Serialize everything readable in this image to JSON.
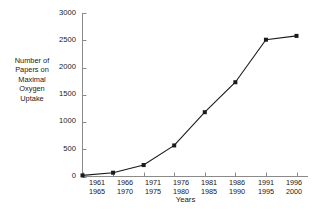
{
  "chart_data": {
    "type": "line",
    "title": "",
    "xlabel": "Years",
    "ylabel": "Number of Papers on Maximal Oxygen Uptake",
    "ylabel_lines": [
      "Number of",
      "Papers on",
      "Maximal",
      "Oxygen",
      "Uptake"
    ],
    "categories": [
      "1961\n1965",
      "1966\n1970",
      "1971\n1975",
      "1976\n1980",
      "1981\n1985",
      "1986\n1990",
      "1991\n1995",
      "1996\n2000"
    ],
    "category_lines": [
      {
        "top": "1961",
        "bottom": "1965"
      },
      {
        "top": "1966",
        "bottom": "1970"
      },
      {
        "top": "1971",
        "bottom": "1975"
      },
      {
        "top": "1976",
        "bottom": "1980"
      },
      {
        "top": "1981",
        "bottom": "1985"
      },
      {
        "top": "1986",
        "bottom": "1990"
      },
      {
        "top": "1991",
        "bottom": "1995"
      },
      {
        "top": "1996",
        "bottom": "2000"
      }
    ],
    "values": [
      20,
      70,
      210,
      570,
      1180,
      1730,
      2510,
      2580
    ],
    "ylim": [
      0,
      3000
    ],
    "yticks": [
      0,
      500,
      1000,
      1500,
      2000,
      2500,
      3000
    ],
    "ytick_labels": [
      "0",
      "500",
      "1000",
      "1500",
      "2000",
      "2500",
      "3000"
    ],
    "grid": false,
    "legend": false,
    "marker": "square",
    "line_color": "#1a1a1a",
    "marker_color": "#1a1a1a",
    "axis_color": "#8a8a8a",
    "background_color": "#ffffff"
  }
}
